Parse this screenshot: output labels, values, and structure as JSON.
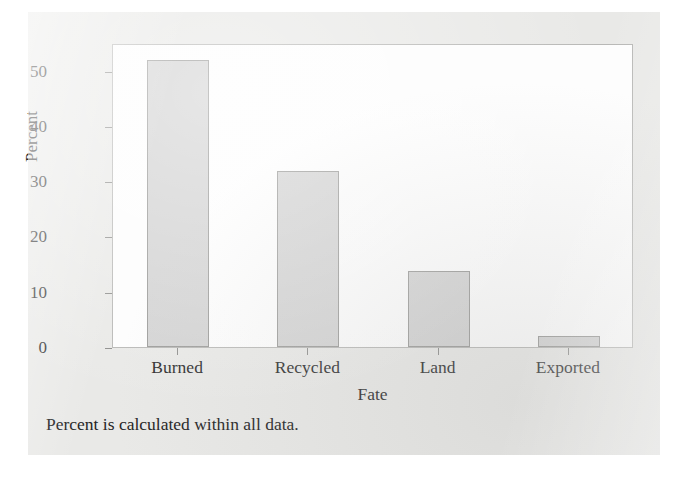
{
  "figure": {
    "caption": "Percent is calculated within all data.",
    "background_color": "#e9e9e7",
    "plot_background_color": "#fdfdfd",
    "frame_color": "#b8b8b6"
  },
  "chart_data": {
    "type": "bar",
    "title": "",
    "categories": [
      "Burned",
      "Recycled",
      "Land",
      "Exported"
    ],
    "values": [
      52.0,
      31.8,
      13.8,
      2.0
    ],
    "xlabel": "Fate",
    "ylabel": "Percent",
    "ylim": [
      0,
      55
    ],
    "yticks": [
      0,
      10,
      20,
      30,
      40,
      50
    ],
    "ytick_labels": [
      "0",
      "10",
      "20",
      "30",
      "40",
      "50"
    ],
    "grid": false,
    "legend": null,
    "bar_color": "#d3d3d3",
    "bar_edge_color": "#9a9a98"
  }
}
